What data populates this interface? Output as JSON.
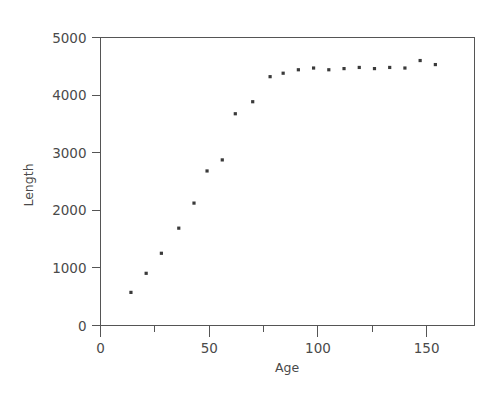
{
  "chart_data": {
    "type": "scatter",
    "title": "",
    "subtitle": "",
    "xlabel": "Age",
    "ylabel": "Length",
    "xlim": [
      0,
      172
    ],
    "ylim": [
      0,
      5000
    ],
    "grid": false,
    "legend": null,
    "x_major_ticks": [
      0,
      50,
      100,
      150
    ],
    "x_major_tick_labels": [
      "0",
      "50",
      "100",
      "150"
    ],
    "x_minor_ticks": [
      25,
      75,
      125
    ],
    "y_major_ticks": [
      0,
      1000,
      2000,
      3000,
      4000,
      5000
    ],
    "y_major_tick_labels": [
      "0",
      "1000",
      "2000",
      "3000",
      "4000",
      "5000"
    ],
    "y_minor_ticks": [],
    "marker": {
      "shape": "square",
      "size_px": 3.2,
      "color": "#3a3a3a"
    },
    "series": [
      {
        "name": "Length vs Age",
        "x": [
          14,
          21,
          28,
          36,
          43,
          49,
          56,
          62,
          70,
          71,
          78,
          84,
          91,
          98,
          105,
          112,
          119,
          126,
          133,
          140,
          147,
          154
        ],
        "y": [
          575,
          906,
          1254,
          1690,
          2125,
          2683,
          2875,
          3676,
          3885,
          4320,
          4380,
          4440,
          4470,
          4460,
          4445,
          4460,
          4480,
          4545,
          4530,
          4545,
          4600,
          4530
        ]
      }
    ],
    "points": [
      {
        "x": 14,
        "y": 575
      },
      {
        "x": 21,
        "y": 906
      },
      {
        "x": 28,
        "y": 1254
      },
      {
        "x": 36,
        "y": 1690
      },
      {
        "x": 43,
        "y": 2125
      },
      {
        "x": 49,
        "y": 2683
      },
      {
        "x": 56,
        "y": 2875
      },
      {
        "x": 62,
        "y": 3676
      },
      {
        "x": 70,
        "y": 3885
      },
      {
        "x": 78,
        "y": 4320
      },
      {
        "x": 84,
        "y": 4380
      },
      {
        "x": 91,
        "y": 4440
      },
      {
        "x": 98,
        "y": 4470
      },
      {
        "x": 105,
        "y": 4440
      },
      {
        "x": 112,
        "y": 4460
      },
      {
        "x": 119,
        "y": 4480
      },
      {
        "x": 126,
        "y": 4460
      },
      {
        "x": 133,
        "y": 4480
      },
      {
        "x": 140,
        "y": 4470
      },
      {
        "x": 147,
        "y": 4600
      },
      {
        "x": 154,
        "y": 4530
      }
    ],
    "colors": {
      "marker": "#3a3a3a",
      "axis": "#555555",
      "text": "#4a4a4a",
      "background": "#ffffff"
    }
  },
  "axes": {
    "x_title": "Age",
    "y_title": "Length"
  }
}
